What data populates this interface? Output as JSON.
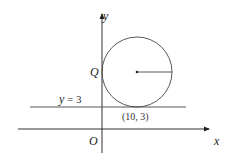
{
  "diagram": {
    "type": "coordinate-geometry",
    "colors": {
      "stroke": "#333333",
      "text": "#222222",
      "background": "#ffffff"
    },
    "axes": {
      "x_label": "x",
      "y_label": "y",
      "origin_label": "O"
    },
    "line": {
      "label_var": "y",
      "label_eq": " = 3"
    },
    "circle": {
      "tangent_point_label": "(10, 3)",
      "axis_tangent_label": "Q"
    }
  }
}
